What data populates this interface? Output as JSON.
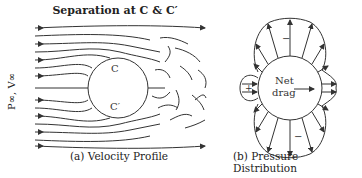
{
  "figure": {
    "title": "Separation at C & C′",
    "freestream_label": "P∞, V∞",
    "panel_a": {
      "caption": "(a) Velocity Profile",
      "point_top": "C",
      "point_bottom": "C′"
    },
    "panel_b": {
      "caption": "(b) Pressure Distribution",
      "center_label_line1": "Net",
      "center_label_line2": "drag",
      "sign_front": "+",
      "sign_top": "−",
      "sign_bottom": "−"
    },
    "colors": {
      "line": "#333333",
      "background": "#ffffff"
    }
  }
}
